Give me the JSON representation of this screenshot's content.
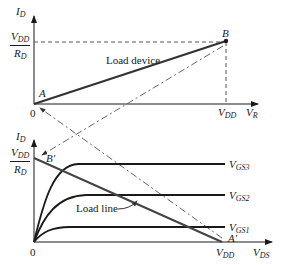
{
  "top_plot": {
    "y_axis_label": "I",
    "y_axis_sub": "D",
    "x_axis_label": "V",
    "x_axis_sub": "R",
    "y_intercept_num": "V",
    "y_intercept_num_sub": "DD",
    "y_intercept_den": "R",
    "y_intercept_den_sub": "D",
    "origin": "0",
    "x_tick_label": "V",
    "x_tick_sub": "DD",
    "point_a": "A",
    "point_b": "B",
    "curve_label": "Load device"
  },
  "bottom_plot": {
    "y_axis_label": "I",
    "y_axis_sub": "D",
    "x_axis_label": "V",
    "x_axis_sub": "DS",
    "y_intercept_num": "V",
    "y_intercept_num_sub": "DD",
    "y_intercept_den": "R",
    "y_intercept_den_sub": "D",
    "origin": "0",
    "x_tick_label": "V",
    "x_tick_sub": "DD",
    "point_b_prime": "B′",
    "point_a_prime": "A′",
    "load_line_label": "Load line",
    "curves": [
      {
        "label": "V",
        "sub": "GS3"
      },
      {
        "label": "V",
        "sub": "GS2"
      },
      {
        "label": "V",
        "sub": "GS1"
      }
    ]
  },
  "colors": {
    "ink": "#1a1a1a",
    "line": "#444444",
    "dash": "#555555"
  }
}
